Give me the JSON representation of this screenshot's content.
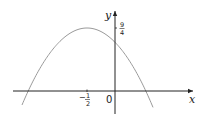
{
  "diagram": {
    "type": "function-graph",
    "axes": {
      "x_label": "x",
      "y_label": "y",
      "origin_label": "0"
    },
    "annotations": {
      "vertex_x_label_sign": "−",
      "vertex_x_label_num": "1",
      "vertex_x_label_den": "2",
      "max_y_label_num": "9",
      "max_y_label_den": "4"
    },
    "curve": {
      "kind": "parabola",
      "opens": "down",
      "vertex_x": -0.5,
      "vertex_y": 2.25,
      "color": "#9a9a9a"
    },
    "axis_color": "#222222"
  }
}
